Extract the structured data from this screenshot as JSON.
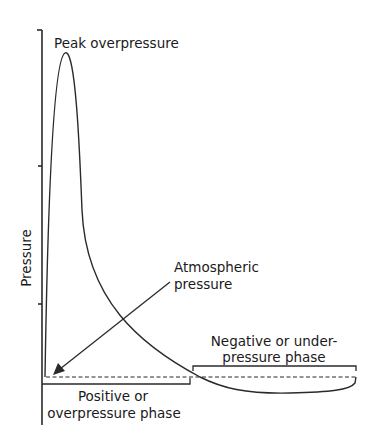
{
  "diagram": {
    "type": "blast-wave-pressure-time-curve",
    "y_axis_label": "Pressure",
    "labels": {
      "peak": "Peak overpressure",
      "atmospheric_line1": "Atmospheric",
      "atmospheric_line2": "pressure",
      "negative_line1": "Negative or under-",
      "negative_line2": "pressure phase",
      "positive_line1": "Positive or",
      "positive_line2": "overpressure phase"
    },
    "colors": {
      "stroke": "#2a2a2a",
      "text": "#1a1a1a",
      "background": "#ffffff"
    }
  }
}
